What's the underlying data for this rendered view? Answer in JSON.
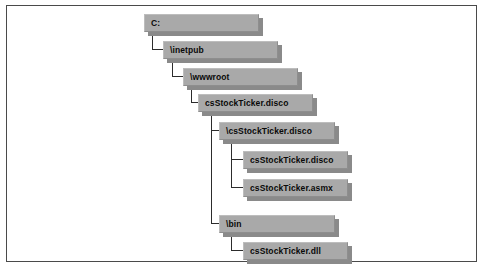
{
  "figure": {
    "type": "directory-tree-diagram",
    "frame_border_color": "#4a4a4a",
    "background_color": "#ffffff",
    "node_fill_color": "#a9a9a9",
    "node_shadow_color": "#8a8a8a",
    "connector_color": "#2c2c2c",
    "text_color": "#0a0a0a"
  },
  "tree": {
    "nodes": [
      {
        "id": "drive",
        "label": "C:",
        "depth": 0
      },
      {
        "id": "inetpub",
        "label": "\\inetpub",
        "depth": 1
      },
      {
        "id": "wwwroot",
        "label": "\\wwwroot",
        "depth": 2
      },
      {
        "id": "folder-disco",
        "label": "csStockTicker.disco",
        "depth": 3
      },
      {
        "id": "sub-disco",
        "label": "\\csStockTicker.disco",
        "depth": 4
      },
      {
        "id": "file-disco",
        "label": "csStockTicker.disco",
        "depth": 5
      },
      {
        "id": "file-asmx",
        "label": "csStockTicker.asmx",
        "depth": 5
      },
      {
        "id": "bin",
        "label": "\\bin",
        "depth": 4
      },
      {
        "id": "file-dll",
        "label": "csStockTicker.dll",
        "depth": 5
      }
    ]
  }
}
